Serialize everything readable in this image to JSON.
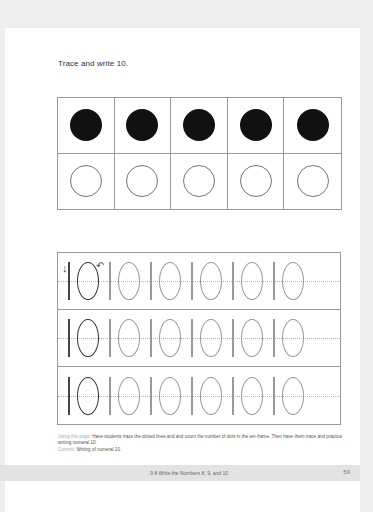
{
  "instruction": "Trace and write 10.",
  "ten_frame": {
    "top_row": [
      "filled",
      "filled",
      "filled",
      "filled",
      "filled"
    ],
    "bottom_row": [
      "empty",
      "empty",
      "empty",
      "empty",
      "empty"
    ],
    "filled_count": 10
  },
  "tracing": {
    "numeral": "10",
    "rows": 3,
    "per_row": 6,
    "start_arrows": [
      "arrow-down",
      "arrow-curve-left"
    ]
  },
  "note": {
    "label1": "Using this page:",
    "text1": "Have students trace the dotted lines and and count the number of dots in the ten-frame. Then have them trace and practice writing numeral 10.",
    "label2": "Commit:",
    "text2": "Writing of numeral 10."
  },
  "footer": {
    "title": "3-8  Write the Numbers 8, 9, and 10",
    "page": "59"
  }
}
